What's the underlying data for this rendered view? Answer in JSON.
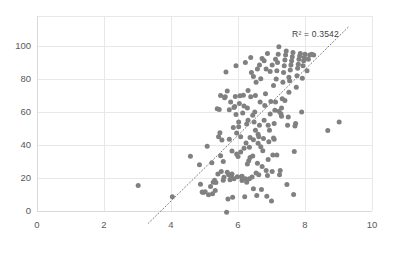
{
  "chart_data": {
    "type": "scatter",
    "title": "",
    "subtitle": "",
    "xlabel": "",
    "ylabel": "",
    "xlim": [
      0,
      10
    ],
    "ylim": [
      0,
      110
    ],
    "xticks": [
      0,
      2,
      4,
      6,
      8,
      10
    ],
    "yticks": [
      0,
      20,
      40,
      60,
      80,
      100
    ],
    "xtick_labels": [
      "0",
      "2",
      "4",
      "6",
      "8",
      "10"
    ],
    "ytick_labels": [
      "0",
      "20",
      "40",
      "60",
      "80",
      "100"
    ],
    "grid": "horizontal-and-vertical",
    "legend": "none",
    "marker_color": "#808080",
    "marker_size": 5,
    "gridline_color": "#e8e8e8",
    "axis_color": "#d9d9d9",
    "tick_label_color": "#595959",
    "annotations": [
      {
        "name": "r-squared",
        "text": "R² = 0.3542",
        "x": 8.45,
        "y": 108
      }
    ],
    "trendline": {
      "type": "linear-dotted",
      "color": "#7f7f7f",
      "style": "dotted",
      "x_start": 3.32,
      "y_start": -7.5,
      "x_end": 9.32,
      "y_end": 112.0,
      "slope": 19.9,
      "intercept": -73.6,
      "r_squared": 0.3542
    },
    "points": [
      [
        3.02,
        15.4
      ],
      [
        4.04,
        8.7
      ],
      [
        4.58,
        33.2
      ],
      [
        4.85,
        28.0
      ],
      [
        4.88,
        16.2
      ],
      [
        4.93,
        11.5
      ],
      [
        4.96,
        11.2
      ],
      [
        5.02,
        11.6
      ],
      [
        5.08,
        39.3
      ],
      [
        5.12,
        9.8
      ],
      [
        5.18,
        14.8
      ],
      [
        5.22,
        29.2
      ],
      [
        5.26,
        17.4
      ],
      [
        5.3,
        18.6
      ],
      [
        5.34,
        17.2
      ],
      [
        5.38,
        62.0
      ],
      [
        5.42,
        45.0
      ],
      [
        5.44,
        61.5
      ],
      [
        5.46,
        47.5
      ],
      [
        5.48,
        70.0
      ],
      [
        5.5,
        24.0
      ],
      [
        5.52,
        43.0
      ],
      [
        5.56,
        18.7
      ],
      [
        5.58,
        20.4
      ],
      [
        5.6,
        68.6
      ],
      [
        5.62,
        69.3
      ],
      [
        5.64,
        84.2
      ],
      [
        5.66,
        -0.8
      ],
      [
        5.68,
        72.8
      ],
      [
        5.7,
        7.3
      ],
      [
        5.72,
        22.0
      ],
      [
        5.74,
        61.3
      ],
      [
        5.76,
        19.0
      ],
      [
        5.78,
        66.0
      ],
      [
        5.8,
        20.5
      ],
      [
        5.82,
        36.4
      ],
      [
        5.84,
        8.3
      ],
      [
        5.86,
        50.6
      ],
      [
        5.88,
        62.8
      ],
      [
        5.9,
        63.4
      ],
      [
        5.92,
        69.4
      ],
      [
        5.94,
        58.5
      ],
      [
        5.96,
        47.2
      ],
      [
        5.98,
        20.8
      ],
      [
        6.0,
        33.0
      ],
      [
        6.02,
        54.0
      ],
      [
        6.04,
        65.2
      ],
      [
        6.06,
        69.8
      ],
      [
        6.08,
        35.8
      ],
      [
        6.1,
        20.8
      ],
      [
        6.12,
        21.0
      ],
      [
        6.14,
        59.4
      ],
      [
        6.16,
        70.2
      ],
      [
        6.18,
        63.7
      ],
      [
        6.2,
        8.6
      ],
      [
        6.22,
        19.5
      ],
      [
        6.24,
        41.2
      ],
      [
        6.26,
        52.8
      ],
      [
        6.28,
        62.5
      ],
      [
        6.3,
        73.0
      ],
      [
        6.32,
        30.4
      ],
      [
        6.34,
        38.6
      ],
      [
        6.36,
        44.6
      ],
      [
        6.38,
        69.2
      ],
      [
        6.4,
        84.0
      ],
      [
        6.42,
        20.6
      ],
      [
        6.44,
        33.4
      ],
      [
        6.46,
        43.2
      ],
      [
        6.48,
        54.0
      ],
      [
        6.5,
        60.0
      ],
      [
        6.52,
        70.0
      ],
      [
        6.54,
        78.0
      ],
      [
        6.56,
        9.4
      ],
      [
        6.58,
        29.0
      ],
      [
        6.6,
        41.0
      ],
      [
        6.62,
        45.0
      ],
      [
        6.64,
        52.0
      ],
      [
        6.66,
        66.0
      ],
      [
        6.68,
        80.2
      ],
      [
        6.7,
        13.0
      ],
      [
        6.72,
        27.0
      ],
      [
        6.74,
        36.5
      ],
      [
        6.76,
        44.0
      ],
      [
        6.78,
        55.0
      ],
      [
        6.8,
        64.0
      ],
      [
        6.82,
        71.0
      ],
      [
        6.84,
        86.0
      ],
      [
        6.86,
        9.0
      ],
      [
        6.88,
        21.5
      ],
      [
        6.9,
        31.2
      ],
      [
        6.92,
        42.0
      ],
      [
        6.94,
        49.0
      ],
      [
        6.96,
        58.8
      ],
      [
        6.98,
        66.4
      ],
      [
        7.0,
        6.0
      ],
      [
        7.02,
        24.0
      ],
      [
        7.04,
        34.0
      ],
      [
        7.06,
        44.2
      ],
      [
        7.08,
        53.0
      ],
      [
        7.1,
        61.0
      ],
      [
        7.12,
        66.0
      ],
      [
        7.14,
        80.0
      ],
      [
        7.16,
        85.0
      ],
      [
        7.18,
        90.0
      ],
      [
        7.2,
        95.0
      ],
      [
        7.22,
        99.5
      ],
      [
        7.24,
        22.0
      ],
      [
        7.26,
        24.5
      ],
      [
        7.28,
        59.0
      ],
      [
        7.3,
        62.5
      ],
      [
        7.32,
        68.0
      ],
      [
        7.34,
        78.0
      ],
      [
        7.36,
        84.0
      ],
      [
        7.38,
        88.0
      ],
      [
        7.4,
        91.5
      ],
      [
        7.42,
        94.5
      ],
      [
        7.44,
        97.0
      ],
      [
        7.46,
        16.0
      ],
      [
        7.48,
        52.0
      ],
      [
        7.5,
        57.0
      ],
      [
        7.52,
        72.0
      ],
      [
        7.54,
        79.0
      ],
      [
        7.56,
        85.5
      ],
      [
        7.58,
        88.5
      ],
      [
        7.6,
        91.0
      ],
      [
        7.62,
        93.5
      ],
      [
        7.64,
        96.0
      ],
      [
        7.66,
        10.0
      ],
      [
        7.68,
        36.0
      ],
      [
        7.7,
        51.5
      ],
      [
        7.72,
        53.0
      ],
      [
        7.74,
        75.0
      ],
      [
        7.76,
        82.0
      ],
      [
        7.78,
        86.5
      ],
      [
        7.8,
        89.0
      ],
      [
        7.82,
        92.0
      ],
      [
        7.84,
        94.0
      ],
      [
        7.86,
        95.5
      ],
      [
        7.9,
        60.0
      ],
      [
        7.92,
        80.5
      ],
      [
        7.94,
        88.0
      ],
      [
        7.96,
        91.0
      ],
      [
        7.98,
        93.0
      ],
      [
        8.0,
        95.0
      ],
      [
        8.06,
        85.0
      ],
      [
        8.1,
        92.0
      ],
      [
        8.14,
        94.5
      ],
      [
        8.2,
        95.0
      ],
      [
        8.26,
        94.5
      ],
      [
        8.68,
        48.8
      ],
      [
        9.02,
        54.0
      ],
      [
        5.94,
        88.0
      ],
      [
        6.22,
        90.0
      ],
      [
        6.38,
        93.0
      ],
      [
        6.58,
        86.0
      ],
      [
        6.72,
        92.5
      ],
      [
        6.88,
        95.5
      ],
      [
        7.02,
        88.5
      ],
      [
        7.12,
        92.0
      ],
      [
        6.46,
        81.5
      ],
      [
        6.64,
        88.5
      ],
      [
        6.78,
        91.0
      ],
      [
        6.96,
        84.5
      ],
      [
        7.06,
        76.0
      ],
      [
        6.3,
        55.0
      ],
      [
        6.44,
        58.0
      ],
      [
        6.52,
        49.0
      ],
      [
        6.6,
        46.5
      ],
      [
        6.68,
        39.0
      ],
      [
        6.36,
        32.5
      ],
      [
        6.28,
        28.5
      ],
      [
        6.18,
        38.0
      ],
      [
        6.08,
        45.0
      ],
      [
        6.02,
        51.0
      ],
      [
        5.96,
        34.5
      ],
      [
        6.12,
        18.5
      ],
      [
        6.26,
        17.5
      ],
      [
        6.34,
        19.5
      ],
      [
        6.46,
        13.5
      ],
      [
        5.88,
        19.5
      ],
      [
        5.82,
        22.5
      ],
      [
        5.74,
        43.5
      ],
      [
        5.68,
        23.5
      ],
      [
        5.56,
        30.0
      ],
      [
        5.48,
        33.5
      ],
      [
        5.4,
        22.5
      ],
      [
        5.32,
        12.5
      ],
      [
        5.24,
        10.5
      ],
      [
        6.54,
        23.0
      ],
      [
        6.62,
        22.0
      ],
      [
        6.84,
        24.5
      ],
      [
        7.08,
        43.5
      ],
      [
        7.16,
        34.0
      ],
      [
        6.9,
        52.0
      ],
      [
        7.22,
        60.5
      ],
      [
        7.3,
        57.5
      ],
      [
        7.4,
        67.0
      ],
      [
        7.52,
        81.0
      ]
    ]
  }
}
